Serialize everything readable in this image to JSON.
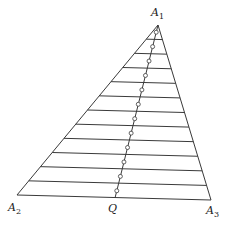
{
  "diagram": {
    "type": "triangle-with-parallel-strips",
    "stroke_color": "#3a3a3a",
    "background": "#ffffff",
    "vertices": {
      "A1": {
        "label": "A",
        "sub": "1",
        "x": 158,
        "y": 25
      },
      "A2": {
        "label": "A",
        "sub": "2",
        "x": 17,
        "y": 195
      },
      "A3": {
        "label": "A",
        "sub": "3",
        "x": 211,
        "y": 200
      }
    },
    "point_Q": {
      "label": "Q",
      "x": 115,
      "y": 198
    },
    "horizontal_lines_count": 11,
    "strip_marker": "small-circle",
    "labels": {
      "a1_main": "A",
      "a1_sub": "1",
      "a2_main": "A",
      "a2_sub": "2",
      "a3_main": "A",
      "a3_sub": "3",
      "q": "Q"
    }
  }
}
